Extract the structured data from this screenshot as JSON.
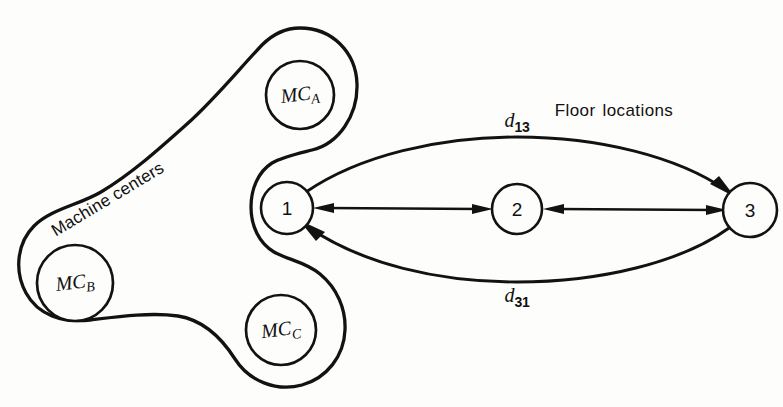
{
  "figure": {
    "background_color": "#fdfdfb",
    "ink_color": "#121212",
    "width": 783,
    "height": 407
  },
  "groups": {
    "machine_centers": {
      "label": "Machine centers",
      "rotation_deg": -31
    },
    "floor_locations": {
      "label": "Floor locations"
    }
  },
  "machine_centers": [
    {
      "id": "mc_a",
      "prefix": "MC",
      "subscript": "A",
      "cx": 300,
      "cy": 95,
      "r": 34
    },
    {
      "id": "mc_b",
      "prefix": "MC",
      "subscript": "B",
      "cx": 75,
      "cy": 283,
      "r": 38
    },
    {
      "id": "mc_c",
      "prefix": "MC",
      "subscript": "C",
      "cx": 281,
      "cy": 330,
      "r": 35
    }
  ],
  "floor_locations": [
    {
      "id": "loc_1",
      "label": "1",
      "cx": 287,
      "cy": 208,
      "r": 26
    },
    {
      "id": "loc_2",
      "label": "2",
      "cx": 517,
      "cy": 209,
      "r": 25
    },
    {
      "id": "loc_3",
      "label": "3",
      "cx": 750,
      "cy": 210,
      "r": 27
    }
  ],
  "links": [
    {
      "id": "link_1_2",
      "from": "loc_1",
      "to": "loc_2",
      "style": "straight",
      "arrows": "both"
    },
    {
      "id": "link_2_3",
      "from": "loc_2",
      "to": "loc_3",
      "style": "straight",
      "arrows": "both"
    },
    {
      "id": "link_1_3",
      "from": "loc_1",
      "to": "loc_3",
      "style": "arc-above",
      "arrows": "to"
    },
    {
      "id": "link_3_1",
      "from": "loc_3",
      "to": "loc_1",
      "style": "arc-below",
      "arrows": "to"
    }
  ],
  "distance_labels": [
    {
      "id": "d13",
      "symbol": "d",
      "subscript": "13",
      "x": 517,
      "y": 122
    },
    {
      "id": "d31",
      "symbol": "d",
      "subscript": "31",
      "x": 517,
      "y": 297
    }
  ],
  "captions": [
    {
      "id": "floor-locations-caption",
      "text": "Floor locations",
      "x": 614,
      "y": 111
    }
  ],
  "rotated_captions": [
    {
      "id": "machine-centers-caption",
      "text": "Machine centers",
      "x": 48,
      "y": 224,
      "rotation_deg": -31
    }
  ]
}
